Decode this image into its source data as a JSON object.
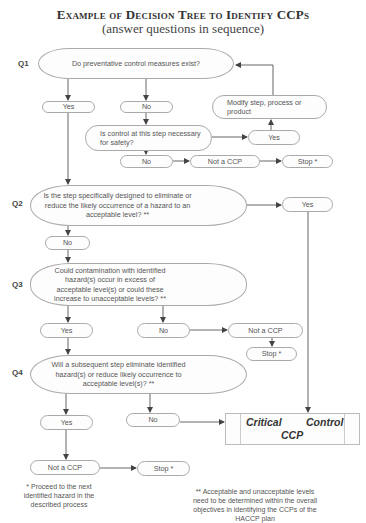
{
  "title": {
    "main": "Example of Decision Tree to Identify CCPs",
    "subtitle": "(answer questions in sequence)"
  },
  "questions": [
    {
      "id": "Q1",
      "label": "Q1",
      "text": "Do preventative control measures exist?"
    },
    {
      "id": "Q2",
      "label": "Q2",
      "text": "Is the step specifically designed to eliminate or reduce the likely occurrence of a hazard to an acceptable level? **"
    },
    {
      "id": "Q3",
      "label": "Q3",
      "text": "Could contamination with identified hazard(s) occur in excess of acceptable level(s) or could these increase to unacceptable levels? **"
    },
    {
      "id": "Q4",
      "label": "Q4",
      "text": "Will a subsequent step eliminate identified hazard(s) or reduce likely occurrence to acceptable level(s)? **"
    }
  ],
  "nodes": {
    "q1_yes": "Yes",
    "q1_no": "No",
    "modify": "Modify step, process or product",
    "control_question": "Is control at this step necessary for safety?",
    "control_yes": "Yes",
    "control_no": "No",
    "control_not_ccp": "Not a CCP",
    "control_stop": "Stop *",
    "q2_yes": "Yes",
    "q2_no": "No",
    "q3_yes": "Yes",
    "q3_no": "No",
    "q3_not_ccp": "Not a CCP",
    "q3_stop": "Stop *",
    "q4_yes": "Yes",
    "q4_no": "No",
    "q4_not_ccp": "Not a CCP",
    "q4_stop": "Stop *",
    "ccp_word1": "Critical",
    "ccp_word2": "Control",
    "ccp_word3": "CCP"
  },
  "footnotes": {
    "single": "* Proceed to the next identified hazard in the described process",
    "double": "** Acceptable and unacceptable levels need to be determined within the overall objectives in identifying the CCPs of the HACCP plan"
  },
  "colors": {
    "line": "#555555",
    "border": "#aaaaaa",
    "text": "#555555"
  }
}
